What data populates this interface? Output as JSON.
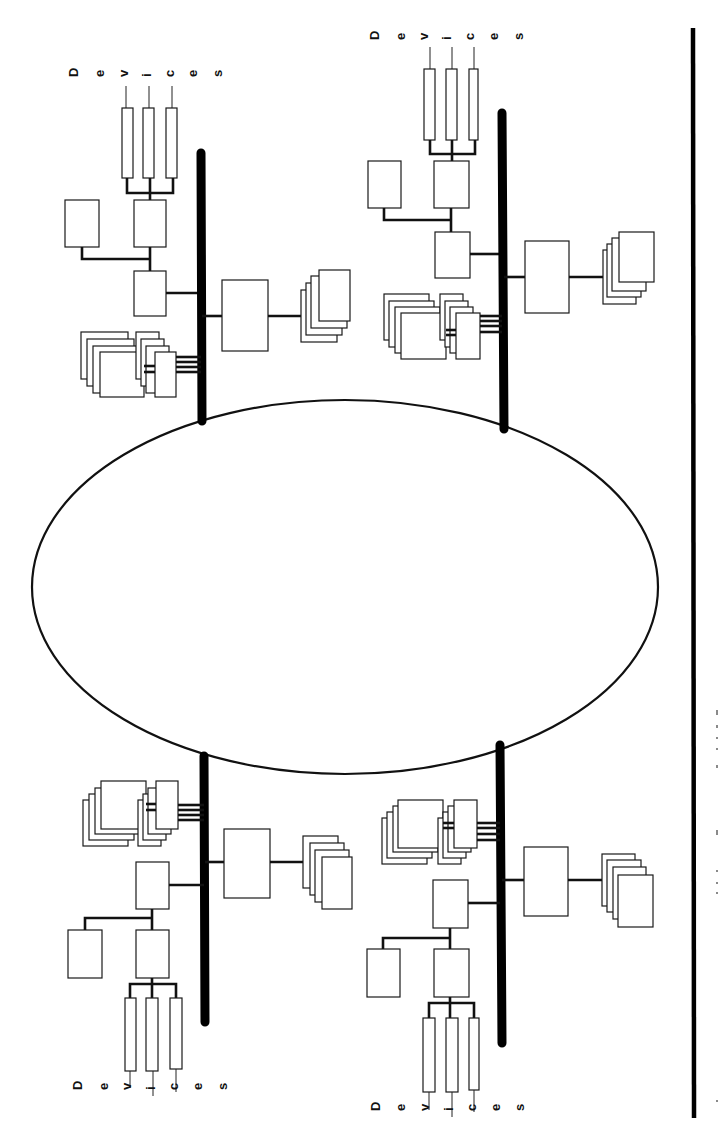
{
  "figure": {
    "orientation": "rotated-90",
    "colors": {
      "line": "#111111",
      "background": "#ffffff"
    }
  },
  "ring": {
    "label": "",
    "cx": 345,
    "cy": 587,
    "rx": 313,
    "ry": 187
  },
  "border_line": {
    "x": 693,
    "y1": 28,
    "y2": 1118
  },
  "faint_side_text": "",
  "segments": [
    {
      "id": "top-left",
      "devices_label": [
        "D",
        "e",
        "v",
        "i",
        "c",
        "e",
        "s"
      ],
      "bus": {
        "x": 201,
        "y1": 153,
        "y2": 421
      }
    },
    {
      "id": "top-right",
      "devices_label": [
        "D",
        "e",
        "v",
        "i",
        "c",
        "e",
        "s"
      ],
      "bus": {
        "x": 502,
        "y1": 113,
        "y2": 429
      }
    },
    {
      "id": "bottom-left",
      "devices_label": [
        "D",
        "e",
        "v",
        "i",
        "c",
        "e",
        "s"
      ],
      "bus": {
        "x": 204,
        "y1": 755,
        "y2": 1022
      }
    },
    {
      "id": "bottom-right",
      "devices_label": [
        "D",
        "e",
        "v",
        "i",
        "c",
        "e",
        "s"
      ],
      "bus": {
        "x": 500,
        "y1": 745,
        "y2": 1043
      }
    }
  ]
}
